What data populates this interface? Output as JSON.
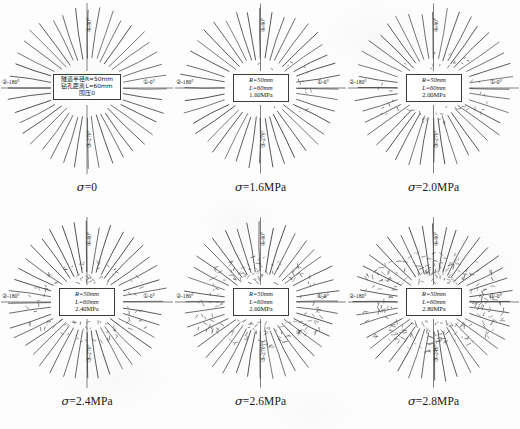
{
  "figure": {
    "background_color": "#fdfdfd",
    "line_color": "#4a4a4a",
    "columns": 3,
    "rows": 2
  },
  "axis_labels": {
    "right": "①-0°",
    "left": "②-180°",
    "bottom": "③-270°",
    "top": "④-90°"
  },
  "panels": [
    {
      "id": "panel-sigma-0",
      "caption_symbol": "σ",
      "caption_value": "=0",
      "caption_full": "σ=0",
      "info_lines": [
        "隧道半径R=50mm",
        "钻孔距离L=60mm",
        "围压0"
      ],
      "info_is_cjk": true,
      "tunnel_radius": "R=50mm",
      "borehole_length": "L=60mm",
      "confining_pressure": "0",
      "spoke_count": 40,
      "inner_radius": 30,
      "outer_radius": 78,
      "damage_level": 0
    },
    {
      "id": "panel-sigma-1p6",
      "caption_symbol": "σ",
      "caption_value": "=1.6MPa",
      "caption_full": "σ=1.6MPa",
      "info_lines": [
        "R=50mm",
        "L=60mm",
        "1.60MPa"
      ],
      "info_is_cjk": false,
      "tunnel_radius": "R=50mm",
      "borehole_length": "L=60mm",
      "confining_pressure": "1.60MPa",
      "spoke_count": 40,
      "inner_radius": 30,
      "outer_radius": 78,
      "damage_level": 1
    },
    {
      "id": "panel-sigma-2p0",
      "caption_symbol": "σ",
      "caption_value": "=2.0MPa",
      "caption_full": "σ=2.0MPa",
      "info_lines": [
        "R=50mm",
        "L=60mm",
        "2.00MPa"
      ],
      "info_is_cjk": false,
      "tunnel_radius": "R=50mm",
      "borehole_length": "L=60mm",
      "confining_pressure": "2.00MPa",
      "spoke_count": 40,
      "inner_radius": 30,
      "outer_radius": 78,
      "damage_level": 2
    },
    {
      "id": "panel-sigma-2p4",
      "caption_symbol": "σ",
      "caption_value": "=2.4MPa",
      "caption_full": "σ=2.4MPa",
      "info_lines": [
        "R=50mm",
        "L=60mm",
        "2.40MPa"
      ],
      "info_is_cjk": false,
      "tunnel_radius": "R=50mm",
      "borehole_length": "L=60mm",
      "confining_pressure": "2.40MPa",
      "spoke_count": 40,
      "inner_radius": 30,
      "outer_radius": 78,
      "damage_level": 3
    },
    {
      "id": "panel-sigma-2p6",
      "caption_symbol": "σ",
      "caption_value": "=2.6MPa",
      "caption_full": "σ=2.6MPa",
      "info_lines": [
        "R=50mm",
        "L=60mm",
        "2.60MPa"
      ],
      "info_is_cjk": false,
      "tunnel_radius": "R=50mm",
      "borehole_length": "L=60mm",
      "confining_pressure": "2.60MPa",
      "spoke_count": 40,
      "inner_radius": 30,
      "outer_radius": 78,
      "damage_level": 4
    },
    {
      "id": "panel-sigma-2p8",
      "caption_symbol": "σ",
      "caption_value": "=2.8MPa",
      "caption_full": "σ=2.8MPa",
      "info_lines": [
        "R=50mm",
        "L=60mm",
        "2.80MPa"
      ],
      "info_is_cjk": false,
      "tunnel_radius": "R=50mm",
      "borehole_length": "L=60mm",
      "confining_pressure": "2.80MPa",
      "spoke_count": 40,
      "inner_radius": 30,
      "outer_radius": 78,
      "damage_level": 5
    }
  ]
}
